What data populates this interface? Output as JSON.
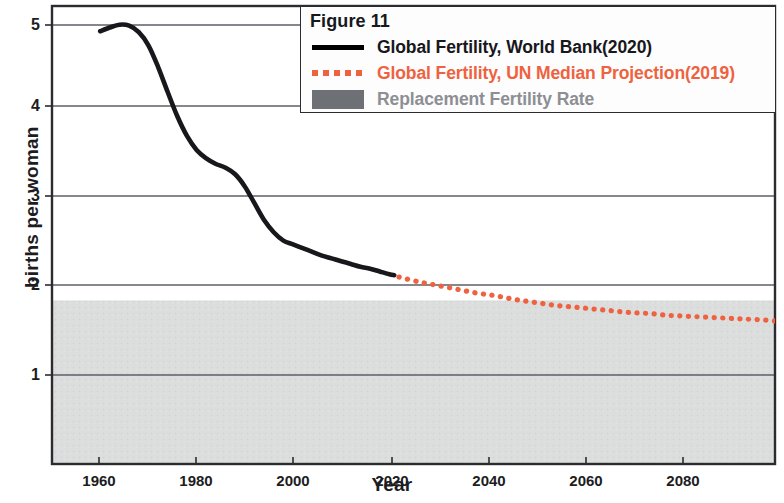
{
  "figure": {
    "legend_title": "Figure 11",
    "legend_entries": [
      {
        "label": "Global Fertility, World Bank(2020)",
        "style": "solid-line",
        "color": "#17171c"
      },
      {
        "label": "Global Fertility, UN Median Projection(2019)",
        "style": "dotted-line",
        "color": "#ef6240"
      },
      {
        "label": "Replacement Fertility Rate",
        "style": "filled-band",
        "color": "#8d8f94"
      }
    ]
  },
  "axes": {
    "xlabel": "Year",
    "ylabel": "births per woman",
    "xticks": [
      "1960",
      "1980",
      "2000",
      "2020",
      "2040",
      "2060",
      "2080"
    ],
    "yticks": [
      "1",
      "2",
      "3",
      "4",
      "5"
    ]
  },
  "chart_data": {
    "type": "line",
    "title": "Figure 11",
    "xlabel": "Year",
    "ylabel": "births per woman",
    "xlim": [
      1950,
      2100
    ],
    "ylim": [
      0.35,
      5.25
    ],
    "xticks": [
      1960,
      1980,
      2000,
      2020,
      2040,
      2060,
      2080
    ],
    "yticks": [
      1,
      2,
      3,
      4,
      5
    ],
    "grid": "horizontal-gridlines-at-yticks",
    "legend_position": "top-right",
    "bands": [
      {
        "name": "Replacement Fertility Rate",
        "color": "#8d8f94",
        "fill_opacity": 0.22,
        "y_from": 0.35,
        "y_to": 2.1,
        "note": "shaded region from replacement level (~2.1) down to bottom of plot"
      }
    ],
    "series": [
      {
        "name": "Global Fertility, World Bank(2020)",
        "style": "solid",
        "color": "#17171c",
        "width": 4.5,
        "x": [
          1960,
          1962,
          1964,
          1966,
          1968,
          1970,
          1972,
          1974,
          1976,
          1978,
          1980,
          1982,
          1984,
          1986,
          1988,
          1990,
          1992,
          1994,
          1996,
          1998,
          2000,
          2002,
          2004,
          2006,
          2008,
          2010,
          2012,
          2014,
          2016,
          2018,
          2020,
          2021
        ],
        "y": [
          4.98,
          5.02,
          5.05,
          5.04,
          4.97,
          4.83,
          4.6,
          4.33,
          4.07,
          3.86,
          3.71,
          3.62,
          3.56,
          3.52,
          3.45,
          3.32,
          3.14,
          2.96,
          2.83,
          2.74,
          2.7,
          2.66,
          2.62,
          2.58,
          2.55,
          2.52,
          2.49,
          2.46,
          2.44,
          2.41,
          2.38,
          2.37
        ]
      },
      {
        "name": "Global Fertility, UN Median Projection(2019)",
        "style": "dotted",
        "color": "#ef6240",
        "width": 5,
        "x": [
          2022,
          2026,
          2030,
          2034,
          2038,
          2042,
          2046,
          2050,
          2054,
          2058,
          2062,
          2066,
          2070,
          2074,
          2078,
          2082,
          2086,
          2090,
          2094,
          2098,
          2100
        ],
        "y": [
          2.35,
          2.3,
          2.26,
          2.22,
          2.18,
          2.15,
          2.11,
          2.08,
          2.05,
          2.03,
          2.01,
          1.99,
          1.97,
          1.96,
          1.94,
          1.93,
          1.92,
          1.91,
          1.9,
          1.89,
          1.88
        ]
      }
    ]
  }
}
